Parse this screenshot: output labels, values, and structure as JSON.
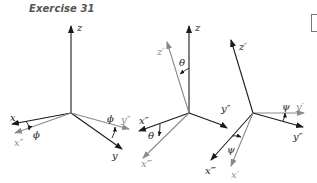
{
  "title": "Exercise 31",
  "colors": {
    "original_axes": "#1a1a1a",
    "rotated_axes": "#8a8a8a"
  },
  "panels": [
    {
      "name": "rotation-phi",
      "angle_label": "ϕ",
      "labels": {
        "z": "z",
        "x": "x",
        "x_new": "x″",
        "y": "y",
        "y_new": "y″",
        "angle": "ϕ",
        "angle2": "ϕ"
      }
    },
    {
      "name": "rotation-theta",
      "labels": {
        "z": "z",
        "z_new": "z′",
        "x": "x″",
        "x_new": "x‴",
        "y": "y″",
        "angle": "θ",
        "angle2": "θ"
      }
    },
    {
      "name": "rotation-psi",
      "labels": {
        "z": "z′",
        "y": "y″",
        "y_new": "y′",
        "x": "x‴",
        "x_new": "x′",
        "angle": "ψ",
        "angle2": "ψ"
      }
    }
  ]
}
